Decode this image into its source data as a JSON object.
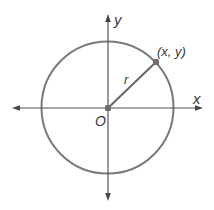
{
  "diagram": {
    "labels": {
      "x_axis": "x",
      "y_axis": "y",
      "origin": "O",
      "radius": "r",
      "point": "(x, y)"
    },
    "colors": {
      "circle": "#7a7a7a",
      "axes": "#555555",
      "radius": "#666666",
      "point": "#6e6e6e",
      "text": "#3a3a3a",
      "background": "#ffffff"
    },
    "geometry": {
      "center": [
        107.5,
        107.5
      ],
      "radius_px": 66,
      "point": [
        156,
        62
      ],
      "x_axis_range": [
        12,
        203
      ],
      "y_axis_range": [
        14,
        201
      ]
    }
  }
}
